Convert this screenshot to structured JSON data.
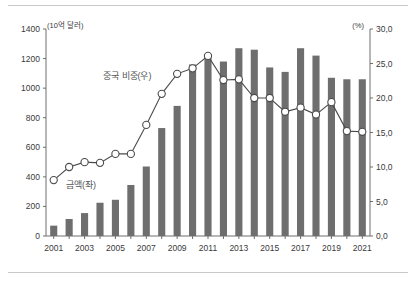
{
  "chart_data": {
    "type": "bar",
    "title": "",
    "subtitle": "",
    "xlabel": "",
    "ylabel": "(10억 달러)",
    "y2label": "(%)",
    "grid": false,
    "legend_position": "inside",
    "categories": [
      "2001",
      "2002",
      "2003",
      "2004",
      "2005",
      "2006",
      "2007",
      "2008",
      "2009",
      "2010",
      "2011",
      "2012",
      "2013",
      "2014",
      "2015",
      "2016",
      "2017",
      "2018",
      "2019",
      "2020",
      "2021"
    ],
    "xtick_labels": [
      "2001",
      "2003",
      "2005",
      "2007",
      "2009",
      "2011",
      "2013",
      "2015",
      "2017",
      "2019",
      "2021"
    ],
    "ylim": [
      0,
      1400
    ],
    "ytick_labels": [
      "0",
      "200",
      "400",
      "600",
      "800",
      "1000",
      "1200",
      "1400"
    ],
    "ytick_values": [
      0,
      200,
      400,
      600,
      800,
      1000,
      1200,
      1400
    ],
    "y2lim": [
      0,
      30
    ],
    "y2tick_labels": [
      "0,0",
      "5,0",
      "10,0",
      "15,0",
      "20,0",
      "25,0",
      "30,0"
    ],
    "y2tick_values": [
      0,
      5,
      10,
      15,
      20,
      25,
      30
    ],
    "series": [
      {
        "name": "금액(좌)",
        "kind": "bar",
        "axis": "left",
        "unit": "10억 달러",
        "color": "#6e6e6e",
        "values": [
          70,
          115,
          155,
          225,
          245,
          345,
          470,
          730,
          880,
          1160,
          1220,
          1180,
          1270,
          1260,
          1140,
          1110,
          1270,
          1220,
          1070,
          1060,
          1060
        ]
      },
      {
        "name": "중국 비중(우)",
        "kind": "line",
        "axis": "right",
        "unit": "%",
        "color": "#4a4a4a",
        "marker": "circle-open",
        "values": [
          8.1,
          10.0,
          10.7,
          10.6,
          11.9,
          11.9,
          16.1,
          20.6,
          23.5,
          24.3,
          26.1,
          22.6,
          22.7,
          20.0,
          20.0,
          18.0,
          18.6,
          17.6,
          19.4,
          15.2,
          15.1
        ]
      }
    ]
  },
  "annotations": {
    "line_series_label": "중국 비중(우)",
    "bar_series_label": "금액(좌)",
    "left_unit": "(10억 달러)",
    "right_unit": "(%)"
  }
}
